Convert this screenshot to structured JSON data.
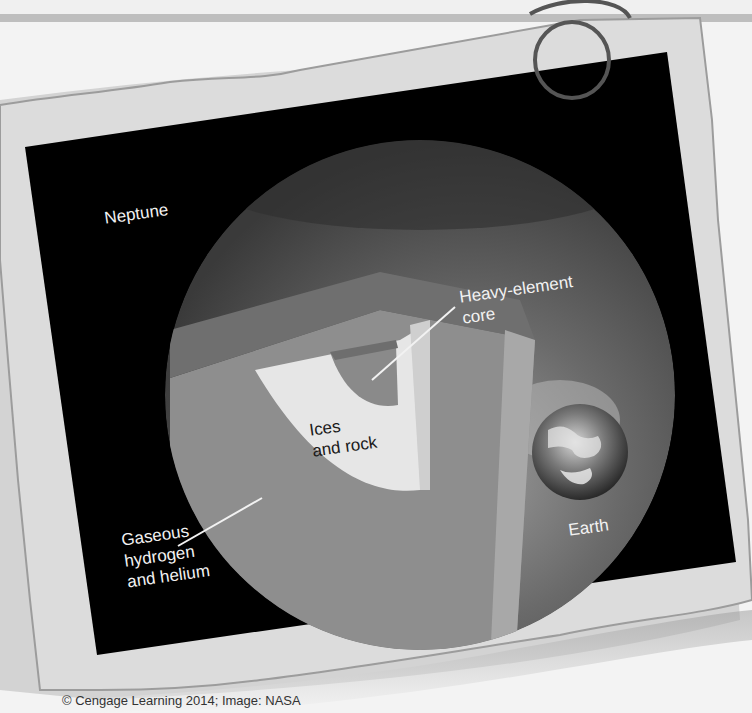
{
  "figure": {
    "planet_name": "Neptune",
    "comparison_name": "Earth",
    "layers": [
      {
        "id": "core",
        "label": "Heavy-element\ncore"
      },
      {
        "id": "mantle",
        "label": "Ices\nand rock"
      },
      {
        "id": "envelope",
        "label": "Gaseous\nhydrogen\nand helium"
      }
    ],
    "colors": {
      "background": "#f3f3f3",
      "paper": "#d9d9d9",
      "panel": "#000000",
      "planet": "#4a4a4a",
      "envelope": "#8c8c8c",
      "mantle": "#e6e6e6",
      "core": "#8a8a8a",
      "label": "#f2f2f2"
    }
  },
  "credit": "© Cengage Learning 2014; Image: NASA"
}
